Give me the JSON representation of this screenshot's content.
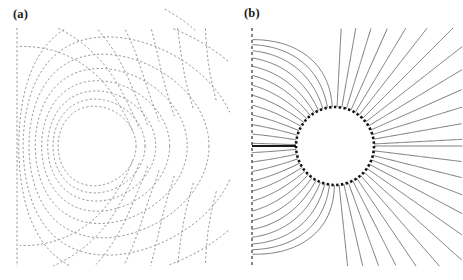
{
  "figure": {
    "width": 463,
    "height": 280,
    "background": "#ffffff",
    "type": "two-panel-field-diagram"
  },
  "panels": [
    {
      "id": "a",
      "label": "(a)",
      "label_x": 13,
      "label_y": 8,
      "origin_x": 0,
      "width": 232,
      "description": "equipotential contours",
      "line_color": "#7a7a7a",
      "line_width": 0.8,
      "dash": "2.2 2.2",
      "center_x": 92,
      "center_y": 146,
      "sphere_radius": 39,
      "wall_x": 17,
      "top_y": 28,
      "bottom_y": 266
    },
    {
      "id": "b",
      "label": "(b)",
      "label_x": 12,
      "label_y": 7,
      "origin_x": 232,
      "width": 231,
      "description": "field streamlines",
      "line_color": "#585858",
      "line_width": 0.8,
      "circle_color": "#111111",
      "circle_width": 2.6,
      "circle_dash": "2.4 2.4",
      "axis_color": "#1a1a1a",
      "axis_width": 2.2,
      "center_x": 103,
      "center_y": 146,
      "sphere_radius": 39,
      "wall_x": 20,
      "top_y": 28,
      "bottom_y": 266
    }
  ],
  "chart_data": {
    "type": "line",
    "title": "",
    "xlabel": "",
    "ylabel": "",
    "panel_a": {
      "type": "contour",
      "series_name": "equipotential lines",
      "style": "dashed",
      "closed_contour_radii": [
        39,
        46,
        54,
        64,
        76,
        90,
        107,
        127
      ],
      "open_contour_offsets": [
        4,
        11,
        20,
        32,
        48,
        68,
        92,
        120
      ],
      "contour_count": 16,
      "eccentricity": 0.12,
      "fragment_arc": {
        "center_x": 92,
        "center_y": 146,
        "radius": 155,
        "start_deg": -62,
        "end_deg": -48
      }
    },
    "panel_b": {
      "type": "streamline",
      "series_name": "field lines",
      "style": "solid",
      "stream_angles_deg": [
        0,
        7,
        14,
        21,
        28,
        35,
        42,
        49,
        56,
        63,
        70,
        77,
        84,
        91,
        98,
        105,
        112,
        119,
        126,
        133,
        140,
        147,
        154,
        161,
        168,
        175,
        182,
        189,
        196,
        203,
        210,
        217,
        224,
        231,
        238,
        245,
        252,
        259,
        266,
        273,
        280,
        287,
        294,
        301,
        308,
        315,
        322,
        329,
        336,
        343,
        350,
        357
      ],
      "stream_count": 52,
      "sphere_boundary": "dashed-circle",
      "left_boundary": "dashed-vertical-line",
      "stagnation_line_y": 146
    }
  }
}
